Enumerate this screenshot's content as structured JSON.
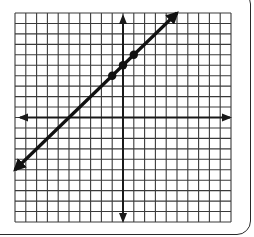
{
  "chart_data": {
    "type": "line",
    "title": "",
    "xlabel": "",
    "ylabel": "",
    "xlim": [
      -10,
      10
    ],
    "ylim": [
      -10,
      10
    ],
    "grid": true,
    "grid_step": 1,
    "legend": null,
    "axes": {
      "x_arrows": true,
      "y_arrows": true,
      "tick_labels": false
    },
    "series": [
      {
        "name": "y = x + 5",
        "equation": {
          "slope": 1,
          "intercept": 5
        },
        "line_from": [
          -10,
          -5
        ],
        "line_to": [
          5,
          10
        ],
        "arrows_both_ends": true,
        "points": [
          [
            -1,
            4
          ],
          [
            0,
            5
          ],
          [
            1,
            6
          ]
        ]
      }
    ]
  },
  "colors": {
    "grid": "#3a3a3a",
    "axis": "#1a1a1a",
    "line": "#111111",
    "background": "#ffffff"
  }
}
